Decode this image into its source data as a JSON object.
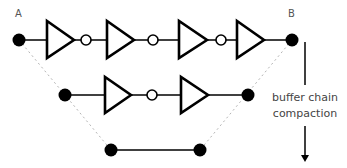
{
  "labels": {
    "a": "A",
    "b": "B"
  },
  "caption": {
    "line1": "buffer chain",
    "line2": "compaction"
  },
  "colors": {
    "stroke": "#000000",
    "dashed": "#b0b0b0",
    "text": "#444444"
  },
  "rows": [
    {
      "name": "original-chain",
      "buffers": 4,
      "inverter_bubbles": 3
    },
    {
      "name": "compacted-chain",
      "buffers": 2,
      "inverter_bubbles": 1
    },
    {
      "name": "direct-wire",
      "buffers": 0,
      "inverter_bubbles": 0
    }
  ]
}
